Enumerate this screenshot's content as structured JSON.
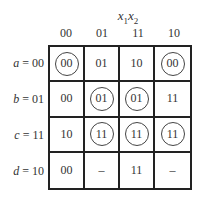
{
  "title": {
    "var1": "x",
    "sub1": "1",
    "var2": "x",
    "sub2": "2"
  },
  "columns": [
    "00",
    "01",
    "11",
    "10"
  ],
  "rows": [
    {
      "var": "a",
      "code": "= 00",
      "cells": [
        {
          "v": "00",
          "c": true
        },
        {
          "v": "01",
          "c": false
        },
        {
          "v": "10",
          "c": false
        },
        {
          "v": "00",
          "c": true
        }
      ]
    },
    {
      "var": "b",
      "code": "= 01",
      "cells": [
        {
          "v": "00",
          "c": false
        },
        {
          "v": "01",
          "c": true
        },
        {
          "v": "01",
          "c": true
        },
        {
          "v": "11",
          "c": false
        }
      ]
    },
    {
      "var": "c",
      "code": "= 11",
      "cells": [
        {
          "v": "10",
          "c": false
        },
        {
          "v": "11",
          "c": true
        },
        {
          "v": "11",
          "c": true
        },
        {
          "v": "11",
          "c": true
        }
      ]
    },
    {
      "var": "d",
      "code": "= 10",
      "cells": [
        {
          "v": "00",
          "c": false
        },
        {
          "v": "–",
          "c": false
        },
        {
          "v": "11",
          "c": false
        },
        {
          "v": "–",
          "c": false
        }
      ]
    }
  ]
}
